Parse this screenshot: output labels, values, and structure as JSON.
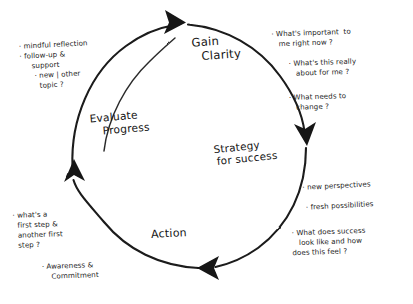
{
  "diagram": {
    "type": "cyclical-process",
    "ink_color": "#1c1c1c",
    "background_color": "#ffffff",
    "style": "hand-drawn whiteboard sketch",
    "phases": [
      {
        "id": "gain-clarity",
        "line1": "Gain",
        "line2": "Clarity",
        "position": "top"
      },
      {
        "id": "strategy-for-success",
        "line1": "Strategy",
        "line2": "for success",
        "position": "right"
      },
      {
        "id": "action",
        "line1": "Action",
        "line2": "",
        "position": "bottom"
      },
      {
        "id": "evaluate-progress",
        "line1": "Evaluate",
        "line2": "Progress",
        "position": "left"
      }
    ],
    "arrows": [
      {
        "id": "arrow-top",
        "direction": "right",
        "between": "Evaluate Progress → Gain Clarity"
      },
      {
        "id": "arrow-right",
        "direction": "down",
        "between": "Gain Clarity → Strategy for success"
      },
      {
        "id": "arrow-bottom",
        "direction": "left",
        "between": "Strategy for success → Action"
      },
      {
        "id": "arrow-left",
        "direction": "up",
        "between": "Action → Evaluate Progress"
      }
    ],
    "annotations": {
      "evaluate_notes": "· mindful reflection\n· follow-up &\n     support\n      · new | other\n        topic ?",
      "clarity_notes_1": "· What's important  to\n   me right now ?\n\n       · What's this really\n          about for me ?",
      "clarity_notes_2": "· What needs to\n   change ?",
      "strategy_notes": "· new perspectives\n\n · fresh possibilities",
      "strategy_notes_2": "· What does success\n   look like and how\ndoes this feel ?",
      "action_notes_1": "· what's a\n  first step &\n  another first\n  step ?",
      "action_notes_2": "· Awareness &\n    Commitment"
    }
  }
}
